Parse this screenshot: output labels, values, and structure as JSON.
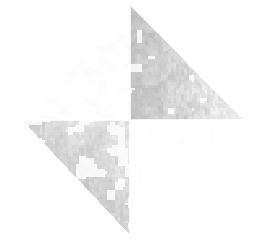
{
  "figure": {
    "title": "Quadrant Noise Diamond",
    "canvas": {
      "width": 262,
      "height": 240,
      "background_color": "#ffffff"
    },
    "shape": {
      "name": "diamond",
      "type": "rhombus",
      "vertices": {
        "top": {
          "x": 130,
          "y": 5
        },
        "left": {
          "x": 22,
          "y": 120
        },
        "right": {
          "x": 243,
          "y": 120
        },
        "bottom": {
          "x": 130,
          "y": 235
        }
      },
      "center": {
        "x": 130,
        "y": 120
      },
      "divider_color": "#ffffff",
      "divider_width": 1.5
    },
    "noise": {
      "description": "blocky grayscale grain, approx 2-3 px blocks",
      "block_size": 2.6,
      "seed": 20240517
    },
    "quadrants": [
      {
        "id": "top-left",
        "label": "Top Left",
        "corner": "top",
        "mean_gray": "#f6f6f6",
        "min_gray": "#e2e2e2",
        "max_gray": "#ffffff",
        "density": 0.34,
        "intensity": 0.17,
        "edge_bias": "hypotenuse-lower-left",
        "edge_strength": 0.22
      },
      {
        "id": "top-right",
        "label": "Top Right",
        "corner": "top",
        "mean_gray": "#d2d2d2",
        "min_gray": "#949494",
        "max_gray": "#ffffff",
        "density": 0.82,
        "intensity": 0.72,
        "edge_bias": "hypotenuse-upper-left",
        "edge_strength": 0.85
      },
      {
        "id": "bottom-left",
        "label": "Bottom Left",
        "corner": "bottom",
        "mean_gray": "#dcdcdc",
        "min_gray": "#8c8c8c",
        "max_gray": "#ffffff",
        "density": 0.66,
        "intensity": 0.55,
        "edge_bias": "hypotenuse-lower-left",
        "edge_strength": 0.7
      },
      {
        "id": "bottom-right",
        "label": "Bottom Right",
        "corner": "bottom",
        "mean_gray": "#fbfbfb",
        "min_gray": "#d8d8d8",
        "max_gray": "#ffffff",
        "density": 0.12,
        "intensity": 0.08,
        "edge_bias": "vertical-center",
        "edge_strength": 0.18
      }
    ]
  },
  "chart_data": {
    "type": "heatmap",
    "title": "Quadrant Noise Diamond",
    "xlabel": "",
    "ylabel": "",
    "grid": false,
    "legend": "none",
    "categories": [
      "Top Left",
      "Top Right",
      "Bottom Left",
      "Bottom Right"
    ],
    "values": [
      0.17,
      0.72,
      0.55,
      0.08
    ],
    "value_label": "mean noise intensity (0 = white, 1 = black)",
    "colors": [
      "#f6f6f6",
      "#d2d2d2",
      "#dcdcdc",
      "#fbfbfb"
    ]
  }
}
